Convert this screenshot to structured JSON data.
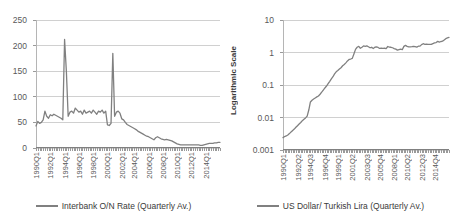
{
  "figure": {
    "background": "#ffffff",
    "line_color": "#808080",
    "grid_color": "#d0d0d0",
    "text_color": "#595959"
  },
  "chart_data": [
    {
      "type": "line",
      "panel": "left",
      "title": "",
      "xlabel": "",
      "ylabel": "",
      "ylim": [
        0,
        250
      ],
      "yticks": [
        "0",
        "50",
        "100",
        "150",
        "200",
        "250"
      ],
      "grid": true,
      "legend_position": "bottom",
      "legend": [
        "Interbank O/N Rate (Quarterly Av.)"
      ],
      "xtick_labels": [
        "1990Q1",
        "1992Q1",
        "1994Q1",
        "1996Q1",
        "1998Q1",
        "2000Q1",
        "2002Q1",
        "2004Q1",
        "2006Q1",
        "2008Q1",
        "2010Q1",
        "2012Q1",
        "2014Q1"
      ],
      "x_start": "1990Q1",
      "x_end": "2015Q4",
      "series": [
        {
          "name": "Interbank O/N Rate (Quarterly Av.)",
          "x": [
            "1990Q1",
            "1990Q2",
            "1990Q3",
            "1990Q4",
            "1991Q1",
            "1991Q2",
            "1991Q3",
            "1991Q4",
            "1992Q1",
            "1992Q2",
            "1992Q3",
            "1992Q4",
            "1993Q1",
            "1993Q2",
            "1993Q3",
            "1993Q4",
            "1994Q1",
            "1994Q2",
            "1994Q3",
            "1994Q4",
            "1995Q1",
            "1995Q2",
            "1995Q3",
            "1995Q4",
            "1996Q1",
            "1996Q2",
            "1996Q3",
            "1996Q4",
            "1997Q1",
            "1997Q2",
            "1997Q3",
            "1997Q4",
            "1998Q1",
            "1998Q2",
            "1998Q3",
            "1998Q4",
            "1999Q1",
            "1999Q2",
            "1999Q3",
            "1999Q4",
            "2000Q1",
            "2000Q2",
            "2000Q3",
            "2000Q4",
            "2001Q1",
            "2001Q2",
            "2001Q3",
            "2001Q4",
            "2002Q1",
            "2002Q2",
            "2002Q3",
            "2002Q4",
            "2003Q1",
            "2003Q2",
            "2003Q3",
            "2003Q4",
            "2004Q1",
            "2004Q2",
            "2004Q3",
            "2004Q4",
            "2005Q1",
            "2005Q2",
            "2005Q3",
            "2005Q4",
            "2006Q1",
            "2006Q2",
            "2006Q3",
            "2006Q4",
            "2007Q1",
            "2007Q2",
            "2007Q3",
            "2007Q4",
            "2008Q1",
            "2008Q2",
            "2008Q3",
            "2008Q4",
            "2009Q1",
            "2009Q2",
            "2009Q3",
            "2009Q4",
            "2010Q1",
            "2010Q2",
            "2010Q3",
            "2010Q4",
            "2011Q1",
            "2011Q2",
            "2011Q3",
            "2011Q4",
            "2012Q1",
            "2012Q2",
            "2012Q3",
            "2012Q4",
            "2013Q1",
            "2013Q2",
            "2013Q3",
            "2013Q4",
            "2014Q1",
            "2014Q2",
            "2014Q3",
            "2014Q4",
            "2015Q1",
            "2015Q2",
            "2015Q3",
            "2015Q4"
          ],
          "values": [
            43,
            52,
            48,
            50,
            55,
            72,
            62,
            58,
            65,
            63,
            66,
            64,
            62,
            60,
            58,
            55,
            212,
            150,
            62,
            70,
            72,
            68,
            78,
            74,
            70,
            72,
            66,
            74,
            68,
            70,
            72,
            68,
            74,
            70,
            66,
            72,
            70,
            74,
            68,
            72,
            45,
            44,
            48,
            185,
            62,
            70,
            72,
            68,
            57,
            55,
            50,
            46,
            44,
            42,
            40,
            38,
            36,
            33,
            31,
            29,
            27,
            25,
            23,
            22,
            20,
            18,
            16,
            20,
            22,
            20,
            18,
            17,
            16,
            17,
            16,
            15,
            14,
            12,
            10,
            8,
            7,
            6,
            6,
            6,
            6,
            6,
            6,
            6,
            6,
            6,
            6,
            6,
            5,
            5,
            6,
            7,
            8,
            9,
            9,
            9,
            10,
            10,
            11,
            11
          ]
        }
      ]
    },
    {
      "type": "line",
      "panel": "right",
      "title": "",
      "xlabel": "",
      "ylabel": "Logarithmic Scale",
      "yscale": "log",
      "ylim": [
        0.001,
        10
      ],
      "yticks": [
        "0.001",
        "0.01",
        "0.1",
        "1",
        "10"
      ],
      "grid": true,
      "legend_position": "bottom",
      "legend": [
        "US Dollar/ Turkish Lira (Quarterly Av.)"
      ],
      "xtick_labels": [
        "1990Q1",
        "1992Q2",
        "1994Q3",
        "1996Q4",
        "1999Q1",
        "2001Q2",
        "2003Q3",
        "2005Q4",
        "2008Q1",
        "2010Q2",
        "2012Q3",
        "2014Q4"
      ],
      "x_start": "1990Q1",
      "x_end": "2015Q4",
      "series": [
        {
          "name": "US Dollar/ Turkish Lira (Quarterly Av.)",
          "x": [
            "1990Q1",
            "1990Q2",
            "1990Q3",
            "1990Q4",
            "1991Q1",
            "1991Q2",
            "1991Q3",
            "1991Q4",
            "1992Q1",
            "1992Q2",
            "1992Q3",
            "1992Q4",
            "1993Q1",
            "1993Q2",
            "1993Q3",
            "1993Q4",
            "1994Q1",
            "1994Q2",
            "1994Q3",
            "1994Q4",
            "1995Q1",
            "1995Q2",
            "1995Q3",
            "1995Q4",
            "1996Q1",
            "1996Q2",
            "1996Q3",
            "1996Q4",
            "1997Q1",
            "1997Q2",
            "1997Q3",
            "1997Q4",
            "1998Q1",
            "1998Q2",
            "1998Q3",
            "1998Q4",
            "1999Q1",
            "1999Q2",
            "1999Q3",
            "1999Q4",
            "2000Q1",
            "2000Q2",
            "2000Q3",
            "2000Q4",
            "2001Q1",
            "2001Q2",
            "2001Q3",
            "2001Q4",
            "2002Q1",
            "2002Q2",
            "2002Q3",
            "2002Q4",
            "2003Q1",
            "2003Q2",
            "2003Q3",
            "2003Q4",
            "2004Q1",
            "2004Q2",
            "2004Q3",
            "2004Q4",
            "2005Q1",
            "2005Q2",
            "2005Q3",
            "2005Q4",
            "2006Q1",
            "2006Q2",
            "2006Q3",
            "2006Q4",
            "2007Q1",
            "2007Q2",
            "2007Q3",
            "2007Q4",
            "2008Q1",
            "2008Q2",
            "2008Q3",
            "2008Q4",
            "2009Q1",
            "2009Q2",
            "2009Q3",
            "2009Q4",
            "2010Q1",
            "2010Q2",
            "2010Q3",
            "2010Q4",
            "2011Q1",
            "2011Q2",
            "2011Q3",
            "2011Q4",
            "2012Q1",
            "2012Q2",
            "2012Q3",
            "2012Q4",
            "2013Q1",
            "2013Q2",
            "2013Q3",
            "2013Q4",
            "2014Q1",
            "2014Q2",
            "2014Q3",
            "2014Q4",
            "2015Q1",
            "2015Q2",
            "2015Q3",
            "2015Q4"
          ],
          "values": [
            0.0024,
            0.0026,
            0.0027,
            0.0029,
            0.0032,
            0.0036,
            0.004,
            0.0044,
            0.005,
            0.0056,
            0.0063,
            0.007,
            0.008,
            0.0088,
            0.0097,
            0.011,
            0.017,
            0.03,
            0.034,
            0.037,
            0.04,
            0.043,
            0.046,
            0.052,
            0.06,
            0.07,
            0.081,
            0.093,
            0.11,
            0.13,
            0.155,
            0.18,
            0.22,
            0.255,
            0.28,
            0.31,
            0.34,
            0.39,
            0.43,
            0.48,
            0.55,
            0.61,
            0.63,
            0.66,
            0.9,
            1.25,
            1.45,
            1.55,
            1.35,
            1.45,
            1.6,
            1.55,
            1.6,
            1.5,
            1.4,
            1.45,
            1.33,
            1.45,
            1.48,
            1.43,
            1.33,
            1.36,
            1.34,
            1.35,
            1.32,
            1.53,
            1.47,
            1.45,
            1.4,
            1.32,
            1.27,
            1.18,
            1.22,
            1.26,
            1.22,
            1.54,
            1.65,
            1.55,
            1.49,
            1.48,
            1.51,
            1.55,
            1.51,
            1.46,
            1.56,
            1.57,
            1.75,
            1.86,
            1.79,
            1.81,
            1.79,
            1.79,
            1.78,
            1.88,
            1.97,
            2.03,
            2.2,
            2.1,
            2.18,
            2.24,
            2.42,
            2.67,
            2.8,
            2.9
          ]
        }
      ]
    }
  ]
}
